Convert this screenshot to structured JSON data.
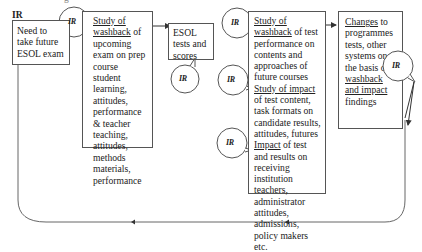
{
  "diagram": {
    "top_cut_text": "g",
    "corner_label": "IR",
    "ir_label": "IR",
    "boxes": {
      "need": {
        "text": "Need to take future ESOL exam"
      },
      "study1": {
        "underlined_1": "Study of",
        "underlined_2": "washback",
        "rest": " of upcoming exam on prep course student learning, attitudes, performance & teacher teaching, attitudes, methods materials, performance"
      },
      "esol": {
        "text": "ESOL tests and scores"
      },
      "study2": {
        "u1": "Study of washback",
        "t1": " of test performance on contents and approaches of future courses",
        "u2": "Study of impact",
        "t2": " of test content, task formats on candidate results, attitudes, futures",
        "u3": "Impact",
        "t3": " of test and results on receiving institution teachers, administrator attitudes, admissions, policy makers etc."
      },
      "changes": {
        "u1": "Changes",
        "t1": " to programmes tests, other systems on the basis of ",
        "u2": "washback and impact",
        "t2": " findings"
      }
    },
    "colors": {
      "line": "#555555",
      "text": "#222222",
      "background": "#ffffff"
    }
  }
}
